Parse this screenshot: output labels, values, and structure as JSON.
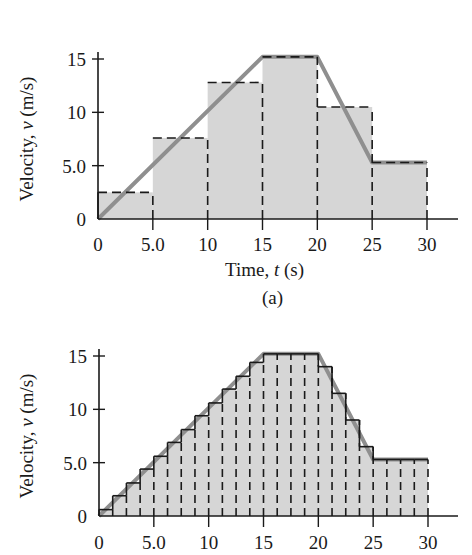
{
  "chart_data": [
    {
      "panel": "(a)",
      "type": "bar",
      "description": "Velocity vs time approximated by 6 rectangles of width 5.0 s (midpoint heights), with the actual velocity curve overlaid",
      "xlabel": "Time, t (s)",
      "ylabel": "Velocity, v (m/s)",
      "xlim": [
        0,
        30
      ],
      "ylim": [
        0,
        15
      ],
      "x_ticks": [
        "0",
        "5.0",
        "10",
        "15",
        "20",
        "25",
        "30"
      ],
      "y_ticks": [
        "0",
        "5.0",
        "10",
        "15"
      ],
      "bar_width": 5.0,
      "bar_left_edges": [
        0,
        5,
        10,
        15,
        20,
        25
      ],
      "values": [
        2.5,
        7.6,
        12.8,
        15.2,
        10.5,
        5.3
      ],
      "curve": {
        "x": [
          0,
          15,
          20,
          25,
          30
        ],
        "y": [
          0,
          15.2,
          15.2,
          5.3,
          5.3
        ]
      },
      "caption": "(a)"
    },
    {
      "panel": "(b)",
      "type": "bar",
      "description": "Same velocity curve approximated by 24 rectangles of width 1.25 s",
      "xlabel": "",
      "ylabel": "Velocity, v (m/s)",
      "xlim": [
        0,
        30
      ],
      "ylim": [
        0,
        15
      ],
      "x_ticks": [
        "0",
        "5.0",
        "10",
        "15",
        "20",
        "25",
        "30"
      ],
      "y_ticks": [
        "0",
        "5.0",
        "10",
        "15"
      ],
      "bar_width": 1.25,
      "values": [
        0.6,
        1.9,
        3.1,
        4.4,
        5.6,
        6.9,
        8.1,
        9.4,
        10.6,
        11.9,
        13.1,
        14.4,
        15.2,
        15.2,
        15.2,
        15.2,
        14.0,
        11.5,
        9.0,
        6.5,
        5.3,
        5.3,
        5.3,
        5.3
      ],
      "curve": {
        "x": [
          0,
          15,
          20,
          25,
          30
        ],
        "y": [
          0,
          15.2,
          15.2,
          5.3,
          5.3
        ]
      }
    }
  ],
  "colors": {
    "fill": "#d6d6d6",
    "curve": "#8f8f8f",
    "ink": "#1a1a1a"
  }
}
